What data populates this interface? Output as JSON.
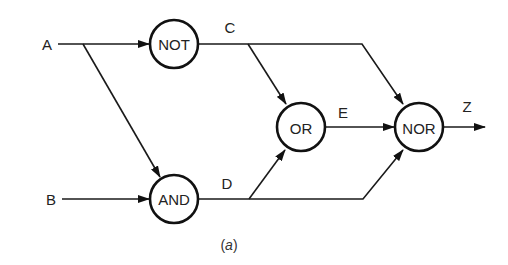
{
  "diagram": {
    "type": "logic-circuit",
    "caption": {
      "open": "(",
      "letter": "a",
      "close": ")"
    },
    "inputs": [
      {
        "id": "A",
        "label": "A"
      },
      {
        "id": "B",
        "label": "B"
      }
    ],
    "gates": [
      {
        "id": "not",
        "label": "NOT",
        "inputs": [
          "A"
        ],
        "output": "C"
      },
      {
        "id": "and",
        "label": "AND",
        "inputs": [
          "A",
          "B"
        ],
        "output": "D"
      },
      {
        "id": "or",
        "label": "OR",
        "inputs": [
          "C",
          "D"
        ],
        "output": "E"
      },
      {
        "id": "nor",
        "label": "NOR",
        "inputs": [
          "C",
          "E",
          "D"
        ],
        "output": "Z"
      }
    ],
    "signals": [
      {
        "id": "C",
        "label": "C"
      },
      {
        "id": "D",
        "label": "D"
      },
      {
        "id": "E",
        "label": "E"
      },
      {
        "id": "Z",
        "label": "Z"
      }
    ],
    "colors": {
      "stroke": "#111111",
      "background": "#ffffff"
    }
  }
}
